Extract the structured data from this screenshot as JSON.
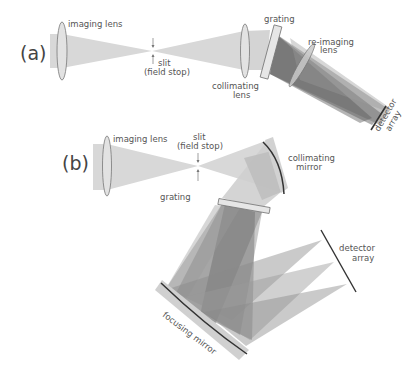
{
  "figure": {
    "panel_a": {
      "tag": "(a)",
      "labels": {
        "imaging_lens": "imaging lens",
        "slit_line1": "slit",
        "slit_line2": "(field stop)",
        "collimating_lens_line1": "collimating",
        "collimating_lens_line2": "lens",
        "grating": "grating",
        "reimaging_lens_line1": "re-imaging",
        "reimaging_lens_line2": "lens",
        "detector_line1": "detector",
        "detector_line2": "array"
      }
    },
    "panel_b": {
      "tag": "(b)",
      "labels": {
        "imaging_lens": "imaging lens",
        "slit_line1": "slit",
        "slit_line2": "(field stop)",
        "grating": "grating",
        "collimating_mirror_line1": "collimating",
        "collimating_mirror_line2": "mirror",
        "detector_line1": "detector",
        "detector_line2": "array",
        "focusing_mirror": "focusing mirror"
      }
    },
    "colors": {
      "beam_light": "#d4d4d4",
      "beam_dark": "#6e6e6e",
      "optic_fill": "#e0e0e0",
      "optic_stroke": "#777777",
      "detector": "#333333",
      "text": "#555555"
    }
  }
}
